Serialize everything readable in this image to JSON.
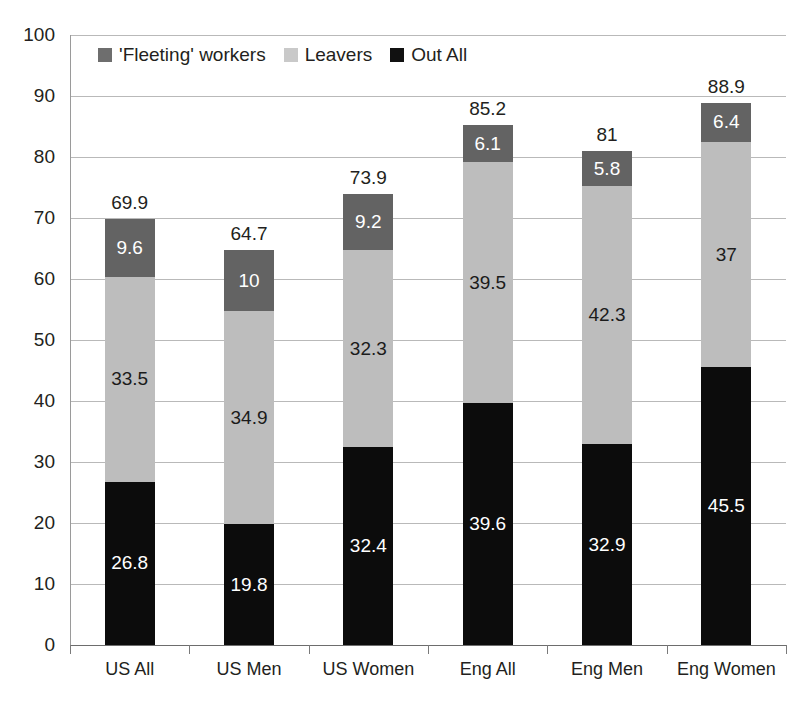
{
  "chart_data": {
    "type": "bar",
    "subtype": "stacked-bar",
    "title": "",
    "xlabel": "",
    "ylabel": "",
    "ylim": [
      0,
      100
    ],
    "ytick_step": 10,
    "yticks": [
      "100",
      "90",
      "80",
      "70",
      "60",
      "50",
      "40",
      "30",
      "20",
      "10",
      "0"
    ],
    "grid": true,
    "legend_position": "top-inside-left",
    "categories": [
      "US All",
      "US Men",
      "US Women",
      "Eng All",
      "Eng Men",
      "Eng Women"
    ],
    "series": [
      {
        "name": "Out All",
        "color": "#0c0c0c",
        "values": [
          26.8,
          19.8,
          32.4,
          39.6,
          32.9,
          45.5
        ],
        "labels": [
          "26.8",
          "19.8",
          "32.4",
          "39.6",
          "32.9",
          "45.5"
        ]
      },
      {
        "name": "Leavers",
        "color": "#bdbdbd",
        "values": [
          33.5,
          34.9,
          32.3,
          39.5,
          42.3,
          37
        ],
        "labels": [
          "33.5",
          "34.9",
          "32.3",
          "39.5",
          "42.3",
          "37"
        ]
      },
      {
        "name": "'Fleeting' workers",
        "color": "#636363",
        "values": [
          9.6,
          10,
          9.2,
          6.1,
          5.8,
          6.4
        ],
        "labels": [
          "9.6",
          "10",
          "9.2",
          "6.1",
          "5.8",
          "6.4"
        ]
      }
    ],
    "totals": [
      69.9,
      64.7,
      73.9,
      85.2,
      81,
      88.9
    ],
    "total_labels": [
      "69.9",
      "64.7",
      "73.9",
      "85.2",
      "81",
      "88.9"
    ]
  },
  "legend": {
    "items": [
      {
        "label": "'Fleeting' workers",
        "swatch": "fleet"
      },
      {
        "label": "Leavers",
        "swatch": "leaver"
      },
      {
        "label": "Out All",
        "swatch": "out"
      }
    ]
  },
  "colors": {
    "fleeting": "#636363",
    "leavers": "#bdbdbd",
    "out_all": "#0c0c0c",
    "gridline": "#b9b9b9",
    "axis": "#6d6d6d",
    "text": "#231f20",
    "background": "#ffffff"
  }
}
